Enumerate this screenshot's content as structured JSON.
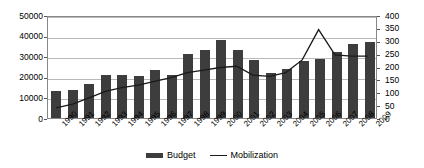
{
  "chart_data": {
    "type": "bar",
    "title": "",
    "subtitle": "",
    "xlabel": "",
    "ylabel": "",
    "y2label": "",
    "grid": true,
    "legend_position": "bottom",
    "categories": [
      "1990",
      "1991",
      "1992",
      "1993",
      "1994",
      "1995",
      "1996",
      "1997",
      "1998",
      "1999",
      "2000",
      "2001",
      "2002",
      "2003",
      "2004",
      "2005",
      "2006",
      "2007",
      "2008",
      "2009"
    ],
    "ylim": [
      0,
      50000
    ],
    "yticks": [
      0,
      10000,
      20000,
      30000,
      40000,
      50000
    ],
    "y2lim": [
      0,
      400
    ],
    "y2ticks": [
      0,
      50,
      100,
      150,
      200,
      250,
      300,
      350,
      400
    ],
    "series": [
      {
        "name": "Budget",
        "axis": "left",
        "type": "bar",
        "color": "#3d3d3d",
        "values": [
          13000,
          13500,
          16500,
          20800,
          21000,
          20500,
          23500,
          20700,
          31000,
          33000,
          38000,
          33000,
          28000,
          22000,
          24000,
          27500,
          28500,
          32000,
          36000,
          37000
        ]
      },
      {
        "name": "Mobilization",
        "axis": "right",
        "type": "line",
        "color": "#1a1a1a",
        "values": [
          40,
          55,
          80,
          105,
          120,
          130,
          145,
          160,
          180,
          190,
          200,
          205,
          170,
          165,
          180,
          230,
          350,
          250,
          245,
          245
        ]
      }
    ]
  },
  "axes": {
    "left_ticks": [
      "50000",
      "40000",
      "30000",
      "20000",
      "10000",
      "0"
    ],
    "right_ticks": [
      "400",
      "350",
      "300",
      "250",
      "200",
      "150",
      "100",
      "50",
      "0"
    ]
  },
  "legend": {
    "items": [
      {
        "label": "Budget",
        "marker": "bar-swatch",
        "color": "#3d3d3d"
      },
      {
        "label": "Mobilization",
        "marker": "line-swatch",
        "color": "#1a1a1a"
      }
    ]
  }
}
